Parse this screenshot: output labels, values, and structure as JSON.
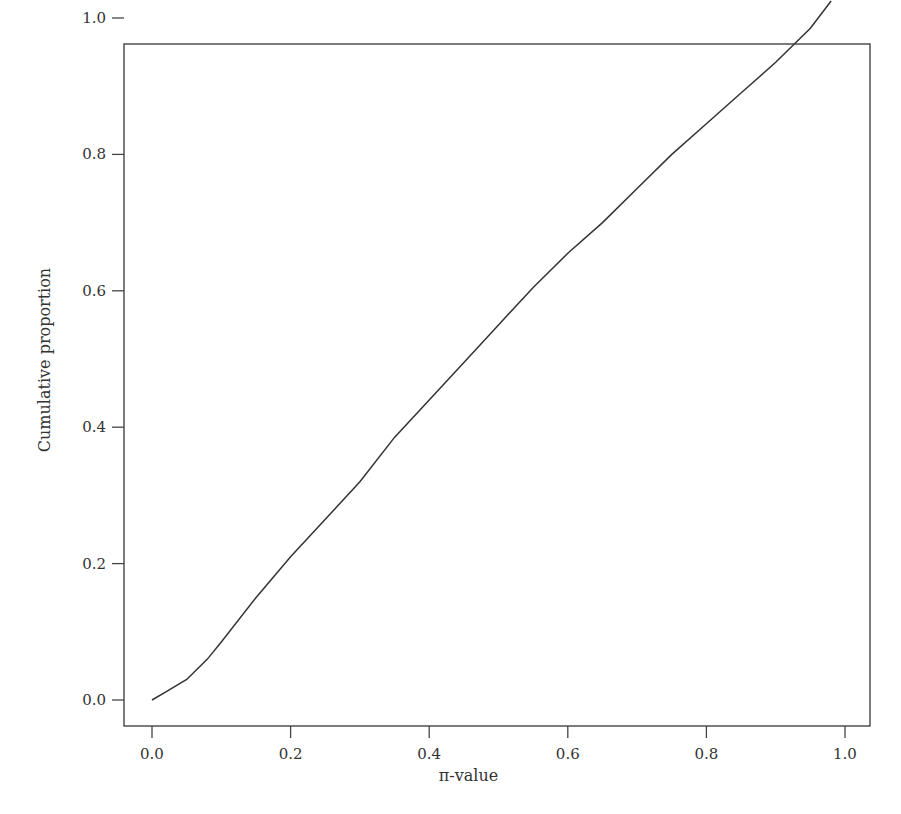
{
  "chart_data": {
    "type": "line",
    "title": "",
    "xlabel": "π-value",
    "ylabel": "Cumulative proportion",
    "xlim": [
      0.0,
      1.0
    ],
    "ylim": [
      0.0,
      1.0
    ],
    "x_ticks": [
      "0.0",
      "0.2",
      "0.4",
      "0.6",
      "0.8",
      "1.0"
    ],
    "y_ticks": [
      "0.0",
      "0.2",
      "0.4",
      "0.6",
      "0.8",
      "1.0"
    ],
    "grid": false,
    "legend": null,
    "series": [
      {
        "name": "cumulative",
        "color": "#333333",
        "x": [
          0.0,
          0.02,
          0.05,
          0.08,
          0.1,
          0.15,
          0.2,
          0.25,
          0.3,
          0.35,
          0.4,
          0.45,
          0.5,
          0.55,
          0.6,
          0.65,
          0.7,
          0.75,
          0.8,
          0.85,
          0.9,
          0.95,
          0.98
        ],
        "y": [
          0.0,
          0.012,
          0.03,
          0.06,
          0.085,
          0.15,
          0.21,
          0.265,
          0.32,
          0.385,
          0.44,
          0.495,
          0.55,
          0.605,
          0.655,
          0.7,
          0.75,
          0.8,
          0.845,
          0.89,
          0.935,
          0.985,
          1.025
        ]
      }
    ]
  },
  "layout": {
    "frame": {
      "left": 124,
      "top": 44,
      "right": 870,
      "bottom": 726
    },
    "x_map": {
      "v0": 152,
      "v1": 845
    },
    "y_map": {
      "v0": 700,
      "v1": 18
    }
  }
}
